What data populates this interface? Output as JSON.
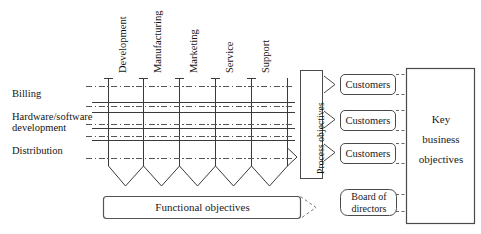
{
  "diagram": {
    "row_labels": [
      {
        "text": "Billing",
        "x": 12,
        "y": 88
      },
      {
        "text": "Hardware/software",
        "x": 12,
        "y": 112
      },
      {
        "text": "development",
        "x": 12,
        "y": 123
      },
      {
        "text": "Distribution",
        "x": 12,
        "y": 146
      }
    ],
    "column_labels": [
      {
        "text": "Development",
        "x": 118,
        "y": 72
      },
      {
        "text": "Manufacturing",
        "x": 153,
        "y": 72
      },
      {
        "text": "Marketing",
        "x": 190,
        "y": 72
      },
      {
        "text": "Service",
        "x": 226,
        "y": 72
      },
      {
        "text": "Support",
        "x": 262,
        "y": 72
      }
    ],
    "process_objectives": {
      "label": "Process objectives",
      "x": 300,
      "y": 70,
      "w": 22,
      "h": 108
    },
    "customers_boxes": [
      {
        "label": "Customers",
        "x": 340,
        "y": 74,
        "w": 55,
        "h": 20
      },
      {
        "label": "Customers",
        "x": 340,
        "y": 110,
        "w": 55,
        "h": 20
      },
      {
        "label": "Customers",
        "x": 340,
        "y": 143,
        "w": 55,
        "h": 20
      }
    ],
    "key_business_objectives": {
      "lines": [
        "Key",
        "business",
        "objectives"
      ],
      "x": 406,
      "y": 68,
      "w": 68,
      "h": 155
    },
    "functional_objectives": {
      "label": "Functional objectives",
      "x": 103,
      "y": 196,
      "w": 197,
      "h": 22
    },
    "board_of_directors": {
      "lines": [
        "Board of",
        "directors"
      ],
      "x": 340,
      "y": 190,
      "w": 56,
      "h": 26
    },
    "grid": {
      "columns_x": [
        108,
        143,
        179,
        215,
        251,
        287
      ],
      "rows_y": [
        86,
        102,
        112,
        128,
        140,
        158
      ],
      "left": 92,
      "right": 295,
      "funnel_bottom": 186
    },
    "colors": {
      "stroke": "#3a3a3a",
      "dash_stroke": "#555555",
      "box_stroke": "#555555",
      "text": "#141414",
      "background": "#ffffff"
    }
  }
}
